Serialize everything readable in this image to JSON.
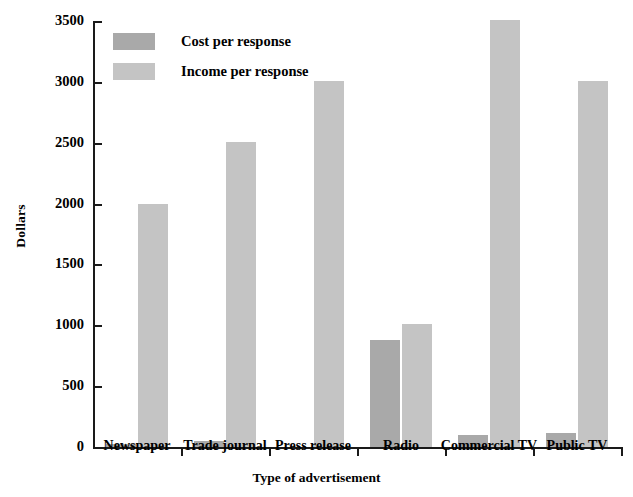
{
  "chart_data": {
    "type": "bar",
    "title": "",
    "xlabel": "Type of advertisement",
    "ylabel": "Dollars",
    "categories": [
      "Newspaper",
      "Trade journal",
      "Press release",
      "Radio",
      "Commercial TV",
      "Public TV"
    ],
    "series": [
      {
        "name": "Cost per response",
        "color": "#a9a9a9",
        "values": [
          25,
          50,
          0,
          880,
          100,
          115
        ]
      },
      {
        "name": "Income per response",
        "color": "#c4c4c4",
        "values": [
          2000,
          2510,
          3010,
          1010,
          3510,
          3010
        ]
      }
    ],
    "ylim": [
      0,
      3500
    ],
    "ytick_step": 500,
    "yticks": [
      0,
      500,
      1000,
      1500,
      2000,
      2500,
      3000,
      3500
    ],
    "ytick_labels": [
      "0",
      "500",
      "1000",
      "1500",
      "2000",
      "2500",
      "3000",
      "3500"
    ],
    "grid": false,
    "legend_position": "upper left inside plot",
    "axis_color": "#1a1a1a",
    "background_color": "#ffffff"
  }
}
